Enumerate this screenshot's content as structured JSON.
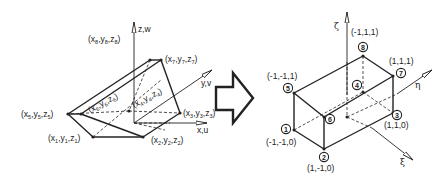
{
  "left_diagram": {
    "title": "Physical element in global coordinates",
    "axes": {
      "z": "z,w",
      "y": "y,v",
      "x": "x,u"
    },
    "nodes": [
      {
        "id": 1,
        "label": "(x",
        "sub": "1",
        "full": "(x1,y1,z1)"
      },
      {
        "id": 2,
        "full": "(x2,y2,z2)"
      },
      {
        "id": 3,
        "full": "(x3,y3,z3)"
      },
      {
        "id": 4,
        "full": "(x4,y4,z4)"
      },
      {
        "id": 5,
        "full": "(x5,y5,z5)"
      },
      {
        "id": 6,
        "full": "(x6,y6,z6)"
      },
      {
        "id": 7,
        "full": "(x7,y7,z7)"
      },
      {
        "id": 8,
        "full": "(x8,y8,z8)"
      }
    ]
  },
  "arrow": {
    "direction": "right",
    "meaning": "maps to"
  },
  "right_diagram": {
    "title": "Parent element in natural coordinates",
    "axes": {
      "zeta": "ζ",
      "eta": "η",
      "xi": "ξ"
    },
    "nodes": [
      {
        "id": "1",
        "coords": "(-1,-1,0)"
      },
      {
        "id": "2",
        "coords": "(1,-1,0)"
      },
      {
        "id": "3",
        "coords": "(1,1,0)"
      },
      {
        "id": "4",
        "coords": ""
      },
      {
        "id": "5",
        "coords": "(-1,-1,1)"
      },
      {
        "id": "6",
        "coords": ""
      },
      {
        "id": "7",
        "coords": "(1,1,1)"
      },
      {
        "id": "8",
        "coords": "(-1,1,1)"
      }
    ]
  },
  "colors": {
    "ink": "#222222",
    "background": "#ffffff"
  }
}
